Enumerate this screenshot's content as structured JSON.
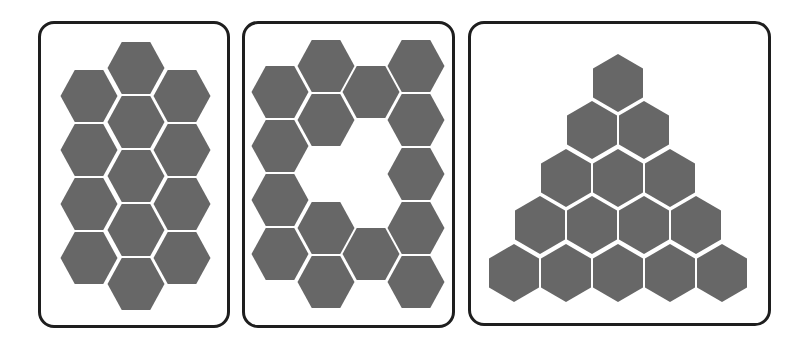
{
  "figure": {
    "hex_color": "#676767",
    "border_color": "#1e1e1e",
    "panels": [
      {
        "id": "panel-1",
        "box": {
          "x": 38,
          "y": 21,
          "w": 192,
          "h": 307
        },
        "orientation": "flat-top",
        "hex_count": 13,
        "hex_size": {
          "w": 57,
          "h": 52
        },
        "hex_centers": [
          [
            136,
            68
          ],
          [
            136,
            122
          ],
          [
            136,
            176
          ],
          [
            136,
            230
          ],
          [
            136,
            284
          ],
          [
            89,
            96
          ],
          [
            89,
            150
          ],
          [
            89,
            204
          ],
          [
            89,
            258
          ],
          [
            182,
            96
          ],
          [
            182,
            150
          ],
          [
            182,
            204
          ],
          [
            182,
            258
          ]
        ]
      },
      {
        "id": "panel-2",
        "box": {
          "x": 242,
          "y": 21,
          "w": 213,
          "h": 307
        },
        "orientation": "flat-top",
        "hex_count": 14,
        "hex_size": {
          "w": 57,
          "h": 52
        },
        "hex_centers": [
          [
            280,
            92
          ],
          [
            280,
            146
          ],
          [
            280,
            200
          ],
          [
            280,
            254
          ],
          [
            326,
            66
          ],
          [
            326,
            120
          ],
          [
            326,
            228
          ],
          [
            326,
            282
          ],
          [
            371,
            92
          ],
          [
            371,
            254
          ],
          [
            416,
            66
          ],
          [
            416,
            120
          ],
          [
            416,
            174
          ],
          [
            416,
            228
          ],
          [
            416,
            282
          ]
        ]
      },
      {
        "id": "panel-3",
        "box": {
          "x": 468,
          "y": 21,
          "w": 303,
          "h": 305
        },
        "orientation": "pointy-top",
        "hex_count": 15,
        "hex_size": {
          "w": 50,
          "h": 58
        },
        "hex_centers": [
          [
            618,
            83
          ],
          [
            592,
            130
          ],
          [
            644,
            130
          ],
          [
            566,
            178
          ],
          [
            618,
            178
          ],
          [
            670,
            178
          ],
          [
            540,
            225
          ],
          [
            592,
            225
          ],
          [
            644,
            225
          ],
          [
            696,
            225
          ],
          [
            514,
            273
          ],
          [
            566,
            273
          ],
          [
            618,
            273
          ],
          [
            670,
            273
          ],
          [
            722,
            273
          ]
        ]
      }
    ]
  }
}
